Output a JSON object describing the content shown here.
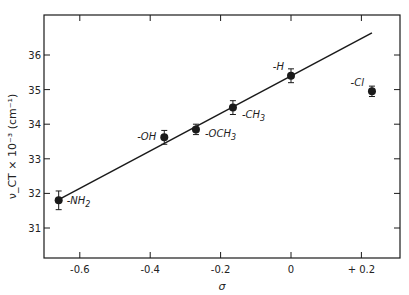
{
  "chart_data": {
    "type": "scatter",
    "title": "",
    "xlabel": "σ",
    "ylabel": "ν_CT × 10⁻³ (cm⁻¹)",
    "xlim": [
      -0.7,
      0.3
    ],
    "ylim": [
      30.1,
      37.0
    ],
    "x_ticks": [
      -0.6,
      -0.4,
      -0.2,
      0,
      0.2
    ],
    "x_tick_labels": [
      "-0.6",
      "-0.4",
      "-0.2",
      "0",
      "+ 0.2"
    ],
    "y_ticks": [
      31,
      32,
      33,
      34,
      35,
      36
    ],
    "y_tick_labels": [
      "31",
      "32",
      "33",
      "34",
      "35",
      "36"
    ],
    "grid": false,
    "legend": null,
    "points": [
      {
        "label": "-NH2",
        "x": -0.66,
        "y": 31.8,
        "err": 0.27
      },
      {
        "label": "-OH",
        "x": -0.36,
        "y": 33.62,
        "err": 0.2
      },
      {
        "label": "-OCH3",
        "x": -0.27,
        "y": 33.85,
        "err": 0.15
      },
      {
        "label": "-CH3",
        "x": -0.165,
        "y": 34.48,
        "err": 0.2
      },
      {
        "label": "-H",
        "x": 0.0,
        "y": 35.4,
        "err": 0.2
      },
      {
        "label": "-Cl",
        "x": 0.23,
        "y": 34.95,
        "err": 0.15
      }
    ],
    "fit_line": {
      "x": [
        -0.66,
        0.23
      ],
      "y": [
        31.82,
        36.64
      ]
    }
  },
  "frame": {
    "left": 44,
    "top": 15,
    "right": 400,
    "bottom": 258
  },
  "calib": {
    "x0_px": 291,
    "px_per_x": 352,
    "y31_px": 228,
    "px_per_y": 34.6
  },
  "colors": {
    "ink": "#1a1a1a",
    "background": "#ffffff"
  }
}
